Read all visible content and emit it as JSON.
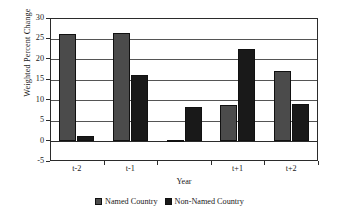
{
  "chart_data": {
    "type": "bar",
    "title": "",
    "xlabel": "Year",
    "ylabel": "Weighted Percent Change",
    "categories": [
      "t-2",
      "t-1",
      "",
      "t+1",
      "t+2"
    ],
    "series": [
      {
        "name": "Named Country",
        "color": "#4b4b4b",
        "values": [
          26.0,
          26.4,
          0.2,
          8.6,
          17.0
        ]
      },
      {
        "name": "Non-Named Country",
        "color": "#191919",
        "values": [
          1.0,
          16.0,
          8.2,
          22.4,
          9.0
        ]
      }
    ],
    "ylim": [
      -5,
      30
    ],
    "yticks": [
      30,
      25,
      20,
      15,
      10,
      5,
      0,
      -5
    ],
    "ytick_labels": [
      "30",
      "25",
      "20",
      "15",
      "10",
      "5",
      "0",
      "-5"
    ],
    "grid": true,
    "grid_axis": "y",
    "legend_position": "bottom-center"
  },
  "axes": {
    "y_title": "Weighted Percent Change",
    "x_title": "Year"
  },
  "legend": {
    "items": [
      {
        "label": "Named Country"
      },
      {
        "label": "Non-Named Country"
      }
    ]
  }
}
